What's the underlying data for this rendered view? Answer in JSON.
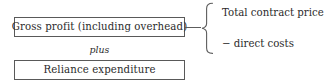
{
  "diagram": {
    "boxes": [
      {
        "id": "gross-profit",
        "label": "Gross profit (including overhead)"
      },
      {
        "id": "reliance-expenditure",
        "label": "Reliance expenditure"
      }
    ],
    "operator": {
      "label": "plus"
    },
    "brace": {
      "icon": "curly-brace-right-icon",
      "items": [
        {
          "label": "Total contract price"
        },
        {
          "label": "− direct costs"
        }
      ]
    },
    "connector": {
      "icon": "horizontal-connector-line-icon"
    },
    "colors": {
      "background": "#ffffff",
      "border": "#595959",
      "text": "#2b2b2b",
      "line": "#5d5d5d"
    }
  }
}
